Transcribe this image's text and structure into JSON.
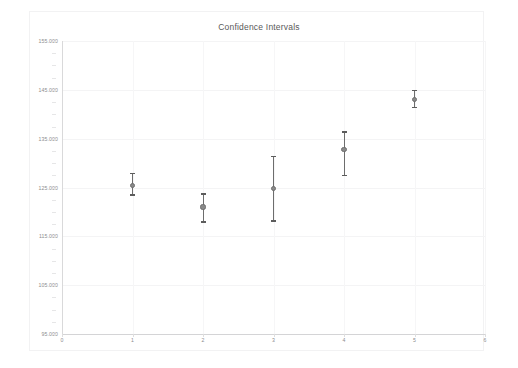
{
  "chart": {
    "title": "Confidence Intervals",
    "background_color": "#ffffff",
    "axis_color": "#d9d9da",
    "grid_color": "#f4f4f5",
    "marker_color": "#8a8a8a",
    "bar_color": "#6d6d6d",
    "label_color": "#8c8c8e"
  },
  "chart_data": {
    "type": "scatter",
    "title": "Confidence Intervals",
    "xlabel": "",
    "ylabel": "",
    "xlim": [
      0,
      6
    ],
    "ylim": [
      95.0,
      155.0
    ],
    "grid": true,
    "legend": null,
    "x_ticks": [
      "0",
      "1",
      "2",
      "3",
      "4",
      "5",
      "6"
    ],
    "x_tick_values": [
      0,
      1,
      2,
      3,
      4,
      5,
      6
    ],
    "y_ticks": [
      "95.000",
      "105.000",
      "115.000",
      "125.000",
      "135.000",
      "145.000",
      "155.000"
    ],
    "y_tick_values": [
      95.0,
      105.0,
      115.0,
      125.0,
      135.0,
      145.0,
      155.0
    ],
    "x": [
      1,
      2,
      3,
      4,
      5
    ],
    "values": [
      125.4,
      121.0,
      124.8,
      132.8,
      143.0
    ],
    "error_low": [
      123.3,
      117.8,
      118.0,
      127.3,
      141.3
    ],
    "error_high": [
      128.0,
      123.8,
      131.5,
      136.5,
      145.0
    ],
    "series": [
      {
        "name": "Confidence Intervals",
        "points": [
          {
            "x": 1,
            "mean": 125.4,
            "lower": 123.3,
            "upper": 128.0
          },
          {
            "x": 2,
            "mean": 121.0,
            "lower": 117.8,
            "upper": 123.8
          },
          {
            "x": 3,
            "mean": 124.8,
            "lower": 118.0,
            "upper": 131.5
          },
          {
            "x": 4,
            "mean": 132.8,
            "lower": 127.3,
            "upper": 136.5
          },
          {
            "x": 5,
            "mean": 143.0,
            "lower": 141.3,
            "upper": 145.0
          }
        ]
      }
    ]
  }
}
